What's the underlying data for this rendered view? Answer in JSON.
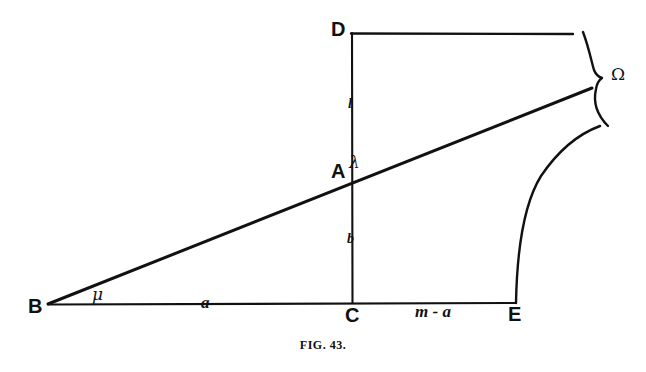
{
  "figure": {
    "caption_prefix": "Fig.",
    "caption_number": "43.",
    "caption_full": "FIG. 43.",
    "background_color": "#ffffff",
    "ink_color": "#111111"
  },
  "points": [
    {
      "id": "B",
      "label": "B",
      "x": 28,
      "y": 296,
      "role": "vertex-left"
    },
    {
      "id": "C",
      "label": "C",
      "x": 345,
      "y": 305,
      "role": "vertex-base-mid"
    },
    {
      "id": "E",
      "label": "E",
      "x": 508,
      "y": 304,
      "role": "vertex-base-right"
    },
    {
      "id": "A",
      "label": "A",
      "x": 331,
      "y": 161,
      "role": "intersection"
    },
    {
      "id": "D",
      "label": "D",
      "x": 331,
      "y": 19,
      "role": "vertex-top"
    }
  ],
  "annotations": [
    {
      "id": "mu",
      "label": "μ",
      "x": 92,
      "y": 286,
      "kind": "greek-italic",
      "meaning": "angle-mu-at-B"
    },
    {
      "id": "lambda",
      "label": "λ",
      "x": 349,
      "y": 154,
      "kind": "greek-italic",
      "meaning": "angle-lambda-at-A"
    },
    {
      "id": "omega",
      "label": "Ω",
      "x": 611,
      "y": 66,
      "kind": "greek-upright",
      "meaning": "brace-label-omega"
    },
    {
      "id": "l",
      "label": "l",
      "x": 348,
      "y": 97,
      "kind": "math-italic",
      "meaning": "segment-length-l"
    },
    {
      "id": "b",
      "label": "b",
      "x": 347,
      "y": 232,
      "kind": "math-italic",
      "meaning": "segment-length-b"
    },
    {
      "id": "a",
      "label": "a",
      "x": 201,
      "y": 294,
      "kind": "math-italic",
      "meaning": "segment-length-a"
    },
    {
      "id": "m-minus-a",
      "label": "m - a",
      "x": 415,
      "y": 303,
      "kind": "math-italic",
      "meaning": "segment-length-m-minus-a"
    }
  ],
  "strokes": {
    "baseline_BE": {
      "from": [
        48,
        304
      ],
      "to": [
        516,
        303
      ],
      "name": "baseline-B-to-E"
    },
    "vertical_CD": {
      "from": [
        352,
        33
      ],
      "to": [
        352,
        303
      ],
      "name": "vertical-C-to-D"
    },
    "top_DR": {
      "from": [
        352,
        33
      ],
      "to": [
        573,
        34
      ],
      "name": "top-edge-D-right"
    },
    "slope_BA": {
      "from": [
        48,
        304
      ],
      "to": [
        592,
        88
      ],
      "name": "slope-B-through-A"
    },
    "curve_E": {
      "from": [
        516,
        303
      ],
      "control": [
        528,
        170
      ],
      "to": [
        600,
        126
      ],
      "name": "curve-from-E"
    },
    "brace": {
      "top": [
        583,
        32
      ],
      "tip": [
        602,
        78
      ],
      "bottom": [
        608,
        126
      ],
      "name": "curly-brace-omega"
    }
  },
  "top_bleed_fragments": [
    {
      "text": "—",
      "x": 72
    },
    {
      "text": "—",
      "x": 228
    },
    {
      "text": "‖",
      "x": 218
    },
    {
      "text": "’",
      "x": 284
    },
    {
      "text": "‖",
      "x": 520
    },
    {
      "text": "·",
      "x": 588
    },
    {
      "text": "○",
      "x": 632
    }
  ]
}
